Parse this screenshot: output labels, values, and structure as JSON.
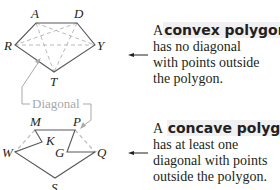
{
  "convex": {
    "vertices": {
      "A": "A",
      "D": "D",
      "R": "R",
      "Y": "Y",
      "T": "T"
    },
    "description": {
      "article": "A",
      "term": "convex polygon",
      "lines": [
        "has no diagonal",
        "with points outside",
        "the polygon."
      ]
    }
  },
  "concave": {
    "vertices": {
      "M": "M",
      "P": "P",
      "K": "K",
      "G": "G",
      "W": "W",
      "Q": "Q",
      "S": "S"
    },
    "description": {
      "article": "A",
      "term": "concave polygon",
      "lines": [
        "has at least one",
        "diagonal with points",
        "outside the polygon."
      ]
    }
  },
  "callout": {
    "label": "Diagonal"
  },
  "colors": {
    "edge": "#58595b",
    "diagonal": "#b8b9bb",
    "highlight": "#f1f1f2",
    "callout": "#a7a9ac"
  }
}
